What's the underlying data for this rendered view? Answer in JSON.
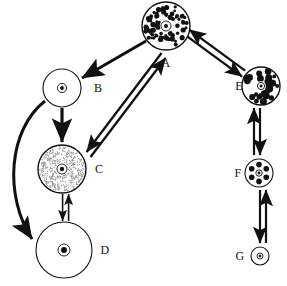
{
  "diagram": {
    "background_color": "#ffffff",
    "ink_color": "#111111",
    "stipple_color": "#8c8c8c",
    "nodes": [
      {
        "id": "A",
        "label": "A",
        "cx": 166,
        "cy": 26,
        "r": 24,
        "fill_style": "dense-black-speckle",
        "label_x": 166,
        "label_y": 67,
        "label_anchor": "middle",
        "nucleus_r": 5,
        "nucleus_dot_r": 2.1,
        "nucleus_fill": "#ffffff",
        "speckle_count": 86,
        "speckle_r": 1.9
      },
      {
        "id": "B",
        "label": "B",
        "cx": 62,
        "cy": 88,
        "r": 19,
        "fill_style": "plain-white",
        "label_x": 98,
        "label_y": 92,
        "label_anchor": "middle",
        "nucleus_r": 4.6,
        "nucleus_dot_r": 1.9,
        "nucleus_fill": "#ffffff",
        "speckle_count": 0,
        "speckle_r": 0
      },
      {
        "id": "C",
        "label": "C",
        "cx": 62,
        "cy": 169,
        "r": 24,
        "fill_style": "fine-stipple",
        "label_x": 99,
        "label_y": 173,
        "label_anchor": "middle",
        "nucleus_r": 5,
        "nucleus_dot_r": 2.2,
        "nucleus_fill": "#ffffff",
        "speckle_count": 470,
        "speckle_r": 0.62
      },
      {
        "id": "D",
        "label": "D",
        "cx": 64,
        "cy": 250,
        "r": 28,
        "fill_style": "plain-white",
        "label_x": 105,
        "label_y": 254,
        "label_anchor": "middle",
        "nucleus_r": 6,
        "nucleus_dot_r": 3,
        "nucleus_fill": "#ffffff",
        "speckle_count": 0,
        "speckle_r": 0
      },
      {
        "id": "E",
        "label": "E",
        "cx": 261,
        "cy": 86,
        "r": 19,
        "fill_style": "coarse-black-blobs",
        "label_x": 239,
        "label_y": 90,
        "label_anchor": "middle",
        "nucleus_r": 3.6,
        "nucleus_dot_r": 1.5,
        "nucleus_fill": "#ffffff",
        "speckle_count": 34,
        "speckle_r": 2.6
      },
      {
        "id": "F",
        "label": "F",
        "cx": 259,
        "cy": 173,
        "r": 14,
        "fill_style": "six-dots",
        "label_x": 238,
        "label_y": 177,
        "label_anchor": "middle",
        "nucleus_r": 3.2,
        "nucleus_dot_r": 1.4,
        "nucleus_fill": "#ffffff",
        "speckle_count": 6,
        "speckle_r": 2.8
      },
      {
        "id": "G",
        "label": "G",
        "cx": 260,
        "cy": 256,
        "r": 9,
        "fill_style": "plain-white",
        "label_x": 240,
        "label_y": 260,
        "label_anchor": "middle",
        "nucleus_r": 3,
        "nucleus_dot_r": 1.3,
        "nucleus_fill": "#ffffff",
        "speckle_count": 0,
        "speckle_r": 0
      }
    ],
    "edges": [
      {
        "id": "A-B",
        "from": "A",
        "to": "B",
        "style": "single-thick",
        "direction": "one-way",
        "x1": 146,
        "y1": 41,
        "x2": 82,
        "y2": 78,
        "width": 3.0,
        "head": "end",
        "head_size": 7
      },
      {
        "id": "A-C-down",
        "from": "A",
        "to": "C",
        "style": "double-thick",
        "direction": "two-way",
        "x1": 159,
        "y1": 51,
        "x2": 84,
        "y2": 150,
        "width": 2.3,
        "head": "end",
        "head_size": 7,
        "offset": -3.2
      },
      {
        "id": "A-C-up",
        "from": "C",
        "to": "A",
        "style": "double-thick",
        "direction": "two-way",
        "x1": 88,
        "y1": 155,
        "x2": 163,
        "y2": 56,
        "width": 2.3,
        "head": "end",
        "head_size": 7,
        "offset": 3.2
      },
      {
        "id": "B-C",
        "from": "B",
        "to": "C",
        "style": "single-thick",
        "direction": "one-way",
        "x1": 62,
        "y1": 108,
        "x2": 62,
        "y2": 142,
        "width": 3.2,
        "head": "end",
        "head_size": 7
      },
      {
        "id": "B-D-curved",
        "from": "B",
        "to": "D",
        "style": "curved-thick",
        "direction": "one-way",
        "path": "M 45 101 C 8 130, 4 196, 32 239",
        "width": 3.0,
        "head": "end",
        "head_size": 7
      },
      {
        "id": "C-D-down",
        "from": "C",
        "to": "D",
        "style": "thin-double",
        "direction": "two-way",
        "x1": 60,
        "y1": 194,
        "x2": 60,
        "y2": 221,
        "width": 1.6,
        "head": "end",
        "head_size": 5,
        "offset": -2.6
      },
      {
        "id": "C-D-up",
        "from": "D",
        "to": "C",
        "style": "thin-double",
        "direction": "two-way",
        "x1": 66,
        "y1": 221,
        "x2": 66,
        "y2": 194,
        "width": 1.6,
        "head": "end",
        "head_size": 5,
        "offset": 2.6
      },
      {
        "id": "A-E-right",
        "from": "A",
        "to": "E",
        "style": "double-thick",
        "direction": "two-way",
        "x1": 188,
        "y1": 33,
        "x2": 244,
        "y2": 74,
        "width": 2.3,
        "head": "end",
        "head_size": 7,
        "offset": 3.2
      },
      {
        "id": "A-E-left",
        "from": "E",
        "to": "A",
        "style": "double-thick",
        "direction": "two-way",
        "x1": 247,
        "y1": 68,
        "x2": 191,
        "y2": 27,
        "width": 2.3,
        "head": "end",
        "head_size": 7,
        "offset": -3.2
      },
      {
        "id": "E-F-down",
        "from": "E",
        "to": "F",
        "style": "double-thick",
        "direction": "two-way",
        "x1": 263,
        "y1": 108,
        "x2": 263,
        "y2": 155,
        "width": 2.2,
        "head": "end",
        "head_size": 6,
        "offset": 3.0
      },
      {
        "id": "E-F-up",
        "from": "F",
        "to": "E",
        "style": "double-thick",
        "direction": "two-way",
        "x1": 257,
        "y1": 155,
        "x2": 257,
        "y2": 108,
        "width": 2.2,
        "head": "end",
        "head_size": 6,
        "offset": -3.0
      },
      {
        "id": "F-G-down",
        "from": "F",
        "to": "G",
        "style": "double-thick",
        "direction": "two-way",
        "x1": 257,
        "y1": 190,
        "x2": 257,
        "y2": 243,
        "width": 2.2,
        "head": "end",
        "head_size": 6,
        "offset": -3.0
      },
      {
        "id": "F-G-up",
        "from": "G",
        "to": "F",
        "style": "double-thick",
        "direction": "two-way",
        "x1": 263,
        "y1": 243,
        "x2": 263,
        "y2": 190,
        "width": 2.2,
        "head": "end",
        "head_size": 6,
        "offset": 3.0
      }
    ]
  }
}
